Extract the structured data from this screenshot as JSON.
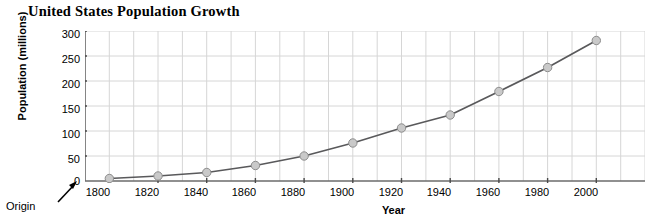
{
  "chart_data": {
    "type": "line",
    "title": "United States Population Growth",
    "xlabel": "Year",
    "ylabel": "Population (millions)",
    "x": [
      1800,
      1820,
      1840,
      1860,
      1880,
      1900,
      1920,
      1940,
      1960,
      1980,
      2000
    ],
    "values": [
      5,
      10,
      17,
      31,
      50,
      76,
      106,
      132,
      179,
      227,
      281
    ],
    "xticklabels": [
      "1800",
      "1820",
      "1840",
      "1860",
      "1880",
      "1900",
      "1920",
      "1940",
      "1960",
      "1980",
      "2000"
    ],
    "yticklabels": [
      "0",
      "50",
      "100",
      "150",
      "200",
      "250",
      "300"
    ],
    "yticks": [
      0,
      50,
      100,
      150,
      200,
      250,
      300
    ],
    "xlim": [
      1790,
      2020
    ],
    "ylim": [
      0,
      300
    ],
    "grid": true,
    "minor_grid_x_step": 10,
    "legend": null,
    "annotations": [
      {
        "text": "Origin",
        "target": "origin",
        "arrow": true
      }
    ],
    "colors": {
      "line": "#59595b",
      "marker_fill": "#c9c9c9",
      "marker_edge": "#8d8d8d",
      "grid": "#d3d3d3",
      "axis": "#6b6b6b",
      "text": "#000000"
    }
  }
}
